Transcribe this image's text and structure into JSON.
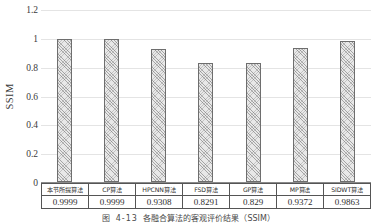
{
  "chart_data": {
    "type": "bar",
    "title": "",
    "xlabel": "",
    "ylabel": "SSIM",
    "ylim": [
      0,
      1.2
    ],
    "grid": true,
    "legend": "none",
    "categories": [
      "本节所提算法",
      "CP算法",
      "HPCNN算法",
      "FSD算法",
      "GP算法",
      "MP算法",
      "SIDWT算法"
    ],
    "values": [
      0.9999,
      0.9999,
      0.9308,
      0.8291,
      0.829,
      0.9372,
      0.9863
    ],
    "value_labels": [
      "0.9999",
      "0.9999",
      "0.9308",
      "0.8291",
      "0.829",
      "0.9372",
      "0.9863"
    ],
    "ytick_labels": [
      "0",
      "0.2",
      "0.4",
      "0.6",
      "0.8",
      "1",
      "1.2"
    ],
    "ytick_values": [
      0,
      0.2,
      0.4,
      0.6,
      0.8,
      1,
      1.2
    ],
    "bar_fill": "#e8e8e8",
    "bar_edge": "#6e6e6e",
    "grid_color": "#e4e4e4"
  },
  "axis": {
    "y_title": "SSIM"
  },
  "caption": {
    "prefix": "图",
    "number": "4-13",
    "text": "各融合算法的客观评价结果（SSIM）"
  }
}
